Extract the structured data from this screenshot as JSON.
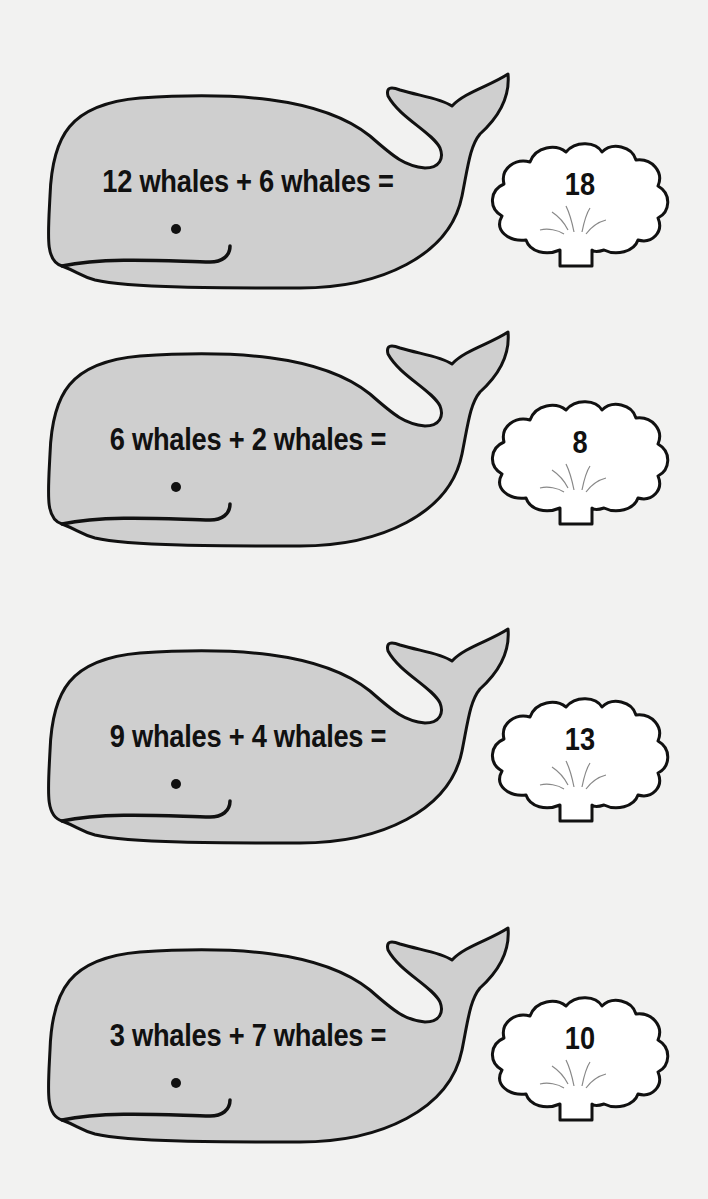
{
  "colors": {
    "background": "#f2f2f1",
    "whale_fill": "#cfcfcf",
    "outline": "#111111",
    "cloud_fill": "#ffffff"
  },
  "problems": [
    {
      "equation": "12 whales + 6 whales =",
      "answer": "18",
      "top": 66
    },
    {
      "equation": "6 whales + 2 whales =",
      "answer": "8",
      "top": 324
    },
    {
      "equation": "9 whales + 4 whales =",
      "answer": "13",
      "top": 621
    },
    {
      "equation": "3 whales + 7 whales =",
      "answer": "10",
      "top": 920
    }
  ]
}
